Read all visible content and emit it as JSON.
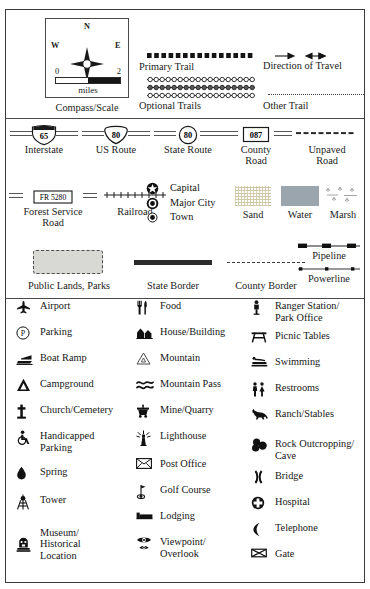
{
  "legend": {
    "title": "Map Legend",
    "compass": {
      "name": "Compass/Scale",
      "north": "N",
      "south": "S",
      "east": "E",
      "west": "W",
      "scale_min": "0",
      "scale_max": "2",
      "scale_units": "miles"
    },
    "trails": [
      {
        "id": "primary-trail",
        "label": "Primary Trail",
        "style": "thick-dashed"
      },
      {
        "id": "optional-trails",
        "label": "Optional Trails",
        "style": "triple-beaded"
      },
      {
        "id": "direction-of-travel",
        "label": "Direction of Travel",
        "style": "arrows"
      },
      {
        "id": "other-trail",
        "label": "Other Trail",
        "style": "fine-dotted"
      }
    ],
    "routes": [
      {
        "id": "interstate",
        "label": "Interstate",
        "number": "65",
        "shape": "interstate-shield"
      },
      {
        "id": "us-route",
        "label": "US Route",
        "number": "80",
        "shape": "us-shield"
      },
      {
        "id": "state-route",
        "label": "State Route",
        "number": "80",
        "shape": "circle"
      },
      {
        "id": "county-road",
        "label": "County\nRoad",
        "number": "087",
        "shape": "rect"
      },
      {
        "id": "unpaved-road",
        "label": "Unpaved\nRoad",
        "number": "",
        "shape": "dashed-line"
      },
      {
        "id": "forest-service-road",
        "label": "Forest Service\nRoad",
        "number": "FR 5280",
        "shape": "rect-wide"
      },
      {
        "id": "railroad",
        "label": "Railroad",
        "number": "",
        "shape": "crosstie-line"
      }
    ],
    "places": [
      {
        "id": "capital",
        "label": "Capital",
        "glyph": "star-in-circle"
      },
      {
        "id": "major-city",
        "label": "Major City",
        "glyph": "dot-in-circle"
      },
      {
        "id": "town",
        "label": "Town",
        "glyph": "small-filled-circle"
      }
    ],
    "fills": [
      {
        "id": "sand",
        "label": "Sand",
        "color": "#e5dfc9"
      },
      {
        "id": "water",
        "label": "Water",
        "color": "#9aa5ae"
      },
      {
        "id": "marsh",
        "label": "Marsh",
        "color": "#ffffff"
      }
    ],
    "areas": [
      {
        "id": "public-lands-parks",
        "label": "Public Lands, Parks",
        "color": "#d8d8d4"
      },
      {
        "id": "state-border",
        "label": "State Border"
      },
      {
        "id": "county-border",
        "label": "County Border"
      },
      {
        "id": "pipeline",
        "label": "Pipeline"
      },
      {
        "id": "powerline",
        "label": "Powerline"
      }
    ],
    "symbols": {
      "column1": [
        {
          "id": "airport",
          "label": "Airport",
          "icon": "airplane-icon"
        },
        {
          "id": "parking",
          "label": "Parking",
          "icon": "parking-p-icon"
        },
        {
          "id": "boat-ramp",
          "label": "Boat Ramp",
          "icon": "boat-ramp-icon"
        },
        {
          "id": "campground",
          "label": "Campground",
          "icon": "tent-icon"
        },
        {
          "id": "church-cemetery",
          "label": "Church/Cemetery",
          "icon": "cross-icon"
        },
        {
          "id": "handicapped-parking",
          "label": "Handicapped\nParking",
          "icon": "wheelchair-icon"
        },
        {
          "id": "spring",
          "label": "Spring",
          "icon": "water-drop-icon"
        },
        {
          "id": "tower",
          "label": "Tower",
          "icon": "tower-icon"
        },
        {
          "id": "museum-historical-location",
          "label": "Museum/\nHistorical\nLocation",
          "icon": "museum-icon"
        }
      ],
      "column2": [
        {
          "id": "food",
          "label": "Food",
          "icon": "fork-knife-icon"
        },
        {
          "id": "house-building",
          "label": "House/Building",
          "icon": "buildings-icon"
        },
        {
          "id": "mountain",
          "label": "Mountain",
          "icon": "mountain-triangle-icon"
        },
        {
          "id": "mountain-pass",
          "label": "Mountain Pass",
          "icon": "double-wave-icon"
        },
        {
          "id": "mine-quarry",
          "label": "Mine/Quarry",
          "icon": "mine-cart-icon"
        },
        {
          "id": "lighthouse",
          "label": "Lighthouse",
          "icon": "lighthouse-icon"
        },
        {
          "id": "post-office",
          "label": "Post Office",
          "icon": "envelope-icon"
        },
        {
          "id": "golf-course",
          "label": "Golf Course",
          "icon": "golf-flag-icon"
        },
        {
          "id": "lodging",
          "label": "Lodging",
          "icon": "bed-icon"
        },
        {
          "id": "viewpoint-overlook",
          "label": "Viewpoint/\nOverlook",
          "icon": "eye-icon"
        }
      ],
      "column3": [
        {
          "id": "ranger-station-park-office",
          "label": "Ranger Station/\nPark Office",
          "icon": "ranger-badge-icon"
        },
        {
          "id": "picnic-tables",
          "label": "Picnic Tables",
          "icon": "picnic-table-icon"
        },
        {
          "id": "swimming",
          "label": "Swimming",
          "icon": "swimmer-icon"
        },
        {
          "id": "restrooms",
          "label": "Restrooms",
          "icon": "restrooms-icon"
        },
        {
          "id": "ranch-stables",
          "label": "Ranch/Stables",
          "icon": "horse-icon"
        },
        {
          "id": "rock-outcropping-cave",
          "label": "Rock Outcropping/\nCave",
          "icon": "rocks-icon"
        },
        {
          "id": "bridge",
          "label": "Bridge",
          "icon": "bridge-icon"
        },
        {
          "id": "hospital",
          "label": "Hospital",
          "icon": "hospital-cross-icon"
        },
        {
          "id": "telephone",
          "label": "Telephone",
          "icon": "telephone-handset-icon"
        },
        {
          "id": "gate",
          "label": "Gate",
          "icon": "gate-icon"
        }
      ]
    }
  }
}
